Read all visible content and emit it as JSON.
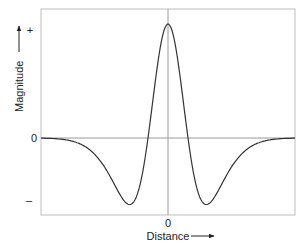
{
  "chart_data": {
    "type": "line",
    "title": "",
    "xlabel": "Distance",
    "ylabel": "Magnitude",
    "x_ticks": [
      {
        "value": 0,
        "label": "0"
      }
    ],
    "y_ticks": [
      {
        "value": 1,
        "label": "+"
      },
      {
        "value": 0,
        "label": "0"
      },
      {
        "value": -0.58,
        "label": "–"
      }
    ],
    "xlim": [
      -127,
      127
    ],
    "ylim": [
      -0.68,
      1.1
    ],
    "grid": false,
    "reference_lines": {
      "horizontal_at": 0,
      "vertical_at": 0
    },
    "legend": null,
    "series": [
      {
        "name": "Magnitude",
        "model": "DoG",
        "params": {
          "A": 2.469,
          "sigma1": 17,
          "B": 1.469,
          "sigma2": 34
        },
        "x": [
          -127,
          -100,
          -80,
          -60,
          -50,
          -39,
          -30,
          -20,
          -10,
          0,
          10,
          20,
          30,
          39,
          50,
          60,
          80,
          100,
          127
        ],
        "values": [
          0.0,
          -0.02,
          -0.09,
          -0.31,
          -0.5,
          -0.58,
          -0.4,
          0.0,
          0.69,
          1.0,
          0.69,
          0.0,
          -0.4,
          -0.58,
          -0.5,
          -0.31,
          -0.09,
          -0.02,
          0.0
        ]
      }
    ]
  },
  "axes": {
    "x_label": "Distance",
    "y_label": "Magnitude",
    "x_zero_label": "0",
    "y_plus_label": "+",
    "y_zero_label": "0",
    "y_minus_label": "–"
  }
}
